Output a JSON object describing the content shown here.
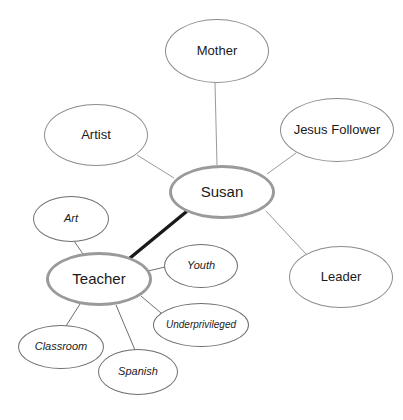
{
  "diagram": {
    "background_color": "#ffffff",
    "hub_border_color": "#9a9a9a",
    "plain_border_color": "#8c8c8c",
    "italic_border_color": "#6e6e6e",
    "thick_edge_color": "#1a1a1a",
    "thin_edge_color": "#9a9a9a",
    "teacher_edge_color": "#6e6e6e"
  },
  "nodes": [
    {
      "id": "susan",
      "label": "Susan",
      "style": "hub",
      "cx": 222,
      "cy": 192,
      "rx": 53,
      "ry": 27
    },
    {
      "id": "teacher",
      "label": "Teacher",
      "style": "hub",
      "cx": 99,
      "cy": 279,
      "rx": 53,
      "ry": 27
    },
    {
      "id": "mother",
      "label": "Mother",
      "style": "plain",
      "cx": 217,
      "cy": 51,
      "rx": 52,
      "ry": 32
    },
    {
      "id": "artist",
      "label": "Artist",
      "style": "plain",
      "cx": 96,
      "cy": 135,
      "rx": 52,
      "ry": 31
    },
    {
      "id": "jesus-follower",
      "label": "Jesus Follower",
      "style": "plain",
      "cx": 337,
      "cy": 130,
      "rx": 57,
      "ry": 32
    },
    {
      "id": "leader",
      "label": "Leader",
      "style": "plain",
      "cx": 341,
      "cy": 277,
      "rx": 52,
      "ry": 31
    },
    {
      "id": "art",
      "label": "Art",
      "style": "italic",
      "cx": 71,
      "cy": 219,
      "rx": 38,
      "ry": 23
    },
    {
      "id": "youth",
      "label": "Youth",
      "style": "italic",
      "cx": 201,
      "cy": 266,
      "rx": 37,
      "ry": 22
    },
    {
      "id": "underprivileged",
      "label": "Underprivileged",
      "style": "italic",
      "cx": 201,
      "cy": 325,
      "rx": 48,
      "ry": 22,
      "tight": true
    },
    {
      "id": "classroom",
      "label": "Classroom",
      "style": "italic",
      "cx": 61,
      "cy": 347,
      "rx": 43,
      "ry": 22
    },
    {
      "id": "spanish",
      "label": "Spanish",
      "style": "italic",
      "cx": 138,
      "cy": 372,
      "rx": 40,
      "ry": 23
    }
  ],
  "edges": [
    {
      "id": "susan-teacher",
      "from": "susan",
      "to": "teacher",
      "weight": "thick",
      "x1": 186,
      "y1": 212,
      "x2": 130,
      "y2": 258
    },
    {
      "id": "susan-mother",
      "from": "susan",
      "to": "mother",
      "weight": "thin",
      "x1": 217,
      "y1": 165,
      "x2": 215,
      "y2": 83
    },
    {
      "id": "susan-artist",
      "from": "susan",
      "to": "artist",
      "weight": "thin",
      "x1": 174,
      "y1": 178,
      "x2": 137,
      "y2": 155
    },
    {
      "id": "susan-jesus-follower",
      "from": "susan",
      "to": "jesus-follower",
      "weight": "thin",
      "x1": 267,
      "y1": 174,
      "x2": 296,
      "y2": 153
    },
    {
      "id": "susan-leader",
      "from": "susan",
      "to": "leader",
      "weight": "thin",
      "x1": 266,
      "y1": 211,
      "x2": 306,
      "y2": 254
    },
    {
      "id": "teacher-art",
      "from": "teacher",
      "to": "art",
      "weight": "thin",
      "x1": 83,
      "y1": 254,
      "x2": 74,
      "y2": 241
    },
    {
      "id": "teacher-youth",
      "from": "teacher",
      "to": "youth",
      "weight": "thin",
      "x1": 148,
      "y1": 271,
      "x2": 165,
      "y2": 267
    },
    {
      "id": "teacher-underprivileged",
      "from": "teacher",
      "to": "underprivileged",
      "weight": "thin",
      "x1": 141,
      "y1": 296,
      "x2": 161,
      "y2": 313
    },
    {
      "id": "teacher-classroom",
      "from": "teacher",
      "to": "classroom",
      "weight": "thin",
      "x1": 80,
      "y1": 304,
      "x2": 66,
      "y2": 326
    },
    {
      "id": "teacher-spanish",
      "from": "teacher",
      "to": "spanish",
      "weight": "thin",
      "x1": 116,
      "y1": 305,
      "x2": 135,
      "y2": 350
    }
  ]
}
